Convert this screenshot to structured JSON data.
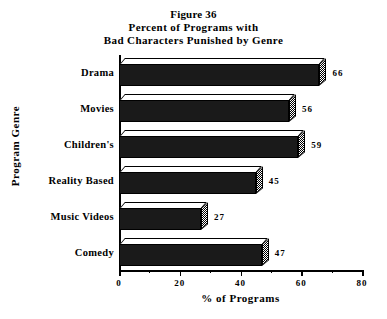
{
  "chart_data": {
    "type": "bar",
    "orientation": "horizontal",
    "title": "Figure 36\nPercent of Programs with\nBad Characters Punished by Genre",
    "title_lines": [
      "Figure 36",
      "Percent of Programs with",
      "Bad Characters Punished by Genre"
    ],
    "categories": [
      "Drama",
      "Movies",
      "Children's",
      "Reality Based",
      "Music Videos",
      "Comedy"
    ],
    "values": [
      66,
      56,
      59,
      45,
      27,
      47
    ],
    "value_labels": [
      "66",
      "56",
      "59",
      "45",
      "27",
      "47"
    ],
    "xlabel": "% of Programs",
    "ylabel": "Program Genre",
    "xlim": [
      0,
      80
    ],
    "xticks": [
      0,
      20,
      40,
      60,
      80
    ],
    "xtick_labels": [
      "0",
      "20",
      "40",
      "60",
      "80"
    ],
    "xticks_minor": [
      10,
      30,
      50,
      70
    ],
    "grid": false,
    "legend": null,
    "style": {
      "bar_fill": "#1a1a1a",
      "bar_top_face": "#ffffff",
      "bar_side_face": "#808080",
      "axis_color": "#000000",
      "background": "#ffffff",
      "three_d": true
    }
  }
}
